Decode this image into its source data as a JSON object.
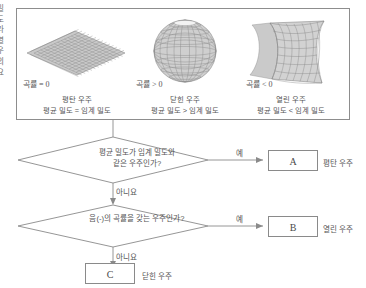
{
  "side_text": {
    "lines": [
      "밀",
      "도",
      "라",
      "열",
      "우",
      "의",
      "요"
    ]
  },
  "top_panel": {
    "panels": [
      {
        "icon": "flat-plane-grid-surface",
        "curvature_label": "곡률 = 0",
        "title": "평탄 우주",
        "condition": "평균 밀도 = 임계 밀도"
      },
      {
        "icon": "sphere-grid-surface",
        "curvature_label": "곡률 > 0",
        "title": "닫힌 우주",
        "condition": "평균 밀도 > 임계 밀도"
      },
      {
        "icon": "saddle-grid-surface",
        "curvature_label": "곡률 < 0",
        "title": "열린 우주",
        "condition": "평균 밀도 < 임계 밀도"
      }
    ]
  },
  "flowchart": {
    "question1": {
      "line1": "평균 밀도가 임계 밀도와",
      "line2": "같은 우주인가?",
      "yes_label": "예",
      "no_label": "아니요"
    },
    "question2": {
      "line1": "음(-)의 곡률을 갖는 우주인가?",
      "yes_label": "예",
      "no_label": "아니요"
    },
    "results": [
      {
        "box": "A",
        "caption": "평탄 우주"
      },
      {
        "box": "B",
        "caption": "열린 우주"
      },
      {
        "box": "C",
        "caption": "닫힌 우주"
      }
    ]
  },
  "colors": {
    "line": "#8a8a8a",
    "text": "#555555",
    "surface": "#9a9a9a"
  }
}
